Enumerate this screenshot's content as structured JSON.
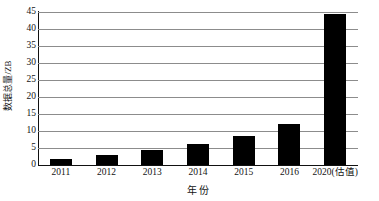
{
  "chart_data": {
    "type": "bar",
    "title": "",
    "subtitle": "",
    "xlabel": "年 份",
    "ylabel": "数据总量/ZB",
    "categories": [
      "2011",
      "2012",
      "2013",
      "2014",
      "2015",
      "2016",
      "2020(估值)"
    ],
    "values": [
      1.8,
      2.8,
      4.4,
      6.2,
      8.6,
      12.2,
      44.4
    ],
    "series": [
      {
        "name": "数据总量",
        "values": [
          1.8,
          2.8,
          4.4,
          6.2,
          8.6,
          12.2,
          44.4
        ]
      }
    ],
    "ylim": [
      0,
      45
    ],
    "xlim_categories": 7,
    "ytick_labels": [
      "0",
      "5",
      "10",
      "15",
      "20",
      "25",
      "30",
      "35",
      "40",
      "45"
    ],
    "ytick_values": [
      0,
      5,
      10,
      15,
      20,
      25,
      30,
      35,
      40,
      45
    ],
    "grid": "horizontal",
    "legend": "none",
    "bar_color": "#000000",
    "gridline_color": "#8c8c8c",
    "axis_color": "#111111",
    "background_color": "#ffffff",
    "annotations": []
  },
  "axes": {
    "y_title": "数据总量/ZB",
    "x_title": "年 份"
  }
}
